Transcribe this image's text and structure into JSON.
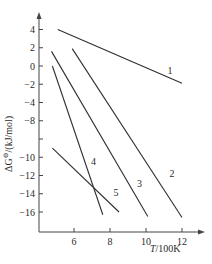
{
  "chart_data": {
    "type": "line",
    "title": "",
    "xlabel": "T/100K",
    "ylabel": "ΔG⊖/(kJ/mol)",
    "xlim": [
      4.2,
      13.0
    ],
    "ylim": [
      -18.0,
      4.6
    ],
    "x_ticks": [
      6,
      8,
      10,
      12
    ],
    "x_tick_labels": [
      "6",
      "8",
      "10",
      "12"
    ],
    "y_ticks": [
      4,
      2,
      0,
      -2,
      -4,
      -6,
      -10,
      -12,
      -14,
      -16
    ],
    "y_tick_positions": [
      4,
      2,
      0,
      -2,
      -4,
      -6,
      -8,
      -10,
      -12,
      -14,
      -16
    ],
    "y_tick_labels": [
      "4",
      "2",
      "0",
      "-2",
      "-4",
      "-8",
      "-10",
      "-12",
      "-14",
      "-16"
    ],
    "y_tick_label_values": [
      4,
      2,
      0,
      -2,
      -4,
      -6,
      -8,
      -10,
      -12,
      -14,
      -16
    ],
    "y_tick_label_text": [
      "4",
      "2",
      "0",
      "-2",
      "-4",
      "-8",
      "",
      "-10",
      "-12",
      "-14",
      "-16"
    ],
    "grid": false,
    "legend": "inline labels next to each line",
    "series": [
      {
        "name": "1",
        "x": [
          5.1,
          12.0
        ],
        "values": [
          4.0,
          -1.9
        ],
        "label_at": [
          11.2,
          -0.9
        ]
      },
      {
        "name": "2",
        "x": [
          5.9,
          12.0
        ],
        "values": [
          1.9,
          -16.6
        ],
        "label_at": [
          11.3,
          -12.2
        ]
      },
      {
        "name": "3",
        "x": [
          4.75,
          10.1
        ],
        "values": [
          1.6,
          -16.5
        ],
        "label_at": [
          9.5,
          -13.3
        ]
      },
      {
        "name": "4",
        "x": [
          4.8,
          7.6
        ],
        "values": [
          0.0,
          -16.3
        ],
        "label_at": [
          6.95,
          -10.8
        ]
      },
      {
        "name": "5",
        "x": [
          4.8,
          8.5
        ],
        "values": [
          -9.0,
          -16.0
        ],
        "label_at": [
          8.2,
          -14.3
        ]
      }
    ]
  },
  "axes": {
    "x_title": "T/100K",
    "y_title_main": "ΔG",
    "y_title_sup": "⊖",
    "y_title_rest": "/(kJ/mol)"
  }
}
